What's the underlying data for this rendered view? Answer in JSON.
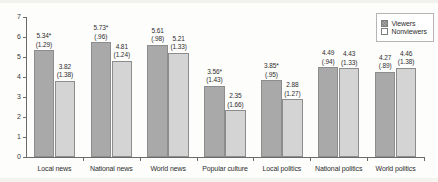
{
  "chart_data": {
    "type": "bar",
    "title": "",
    "xlabel": "",
    "ylabel": "",
    "ylim": [
      0,
      7
    ],
    "yticks": [
      0,
      1,
      2,
      3,
      4,
      5,
      6,
      7
    ],
    "grid": false,
    "legend_position": "top-right",
    "categories": [
      "Local news",
      "National news",
      "World news",
      "Popular culture",
      "Local politics",
      "National politics",
      "World politics"
    ],
    "series": [
      {
        "name": "Viewers",
        "color": "#a9a9a9",
        "values": [
          5.34,
          5.73,
          5.61,
          3.56,
          3.85,
          4.49,
          4.27
        ],
        "value_labels": [
          "5.34*",
          "5.73*",
          "5.61",
          "3.56*",
          "3.85*",
          "4.49",
          "4.27"
        ],
        "sd_labels": [
          "(1.29)",
          "(.96)",
          "(.98)",
          "(1.43)",
          "(.95)",
          "(.94)",
          "(.89)"
        ]
      },
      {
        "name": "Nonviewers",
        "color": "#d4d4d4",
        "values": [
          3.82,
          4.81,
          5.21,
          2.35,
          2.88,
          4.43,
          4.46
        ],
        "value_labels": [
          "3.82",
          "4.81",
          "5.21",
          "2.35",
          "2.88",
          "4.43",
          "4.46"
        ],
        "sd_labels": [
          "(1.38)",
          "(1.24)",
          "(1.33)",
          "(1.66)",
          "(1.27)",
          "(1.33)",
          "(1.38)"
        ]
      }
    ]
  },
  "legend": {
    "items": [
      {
        "label": "Viewers",
        "swatch": "viewers-swatch-icon"
      },
      {
        "label": "Nonviewers",
        "swatch": "nonviewers-swatch-icon"
      }
    ]
  }
}
